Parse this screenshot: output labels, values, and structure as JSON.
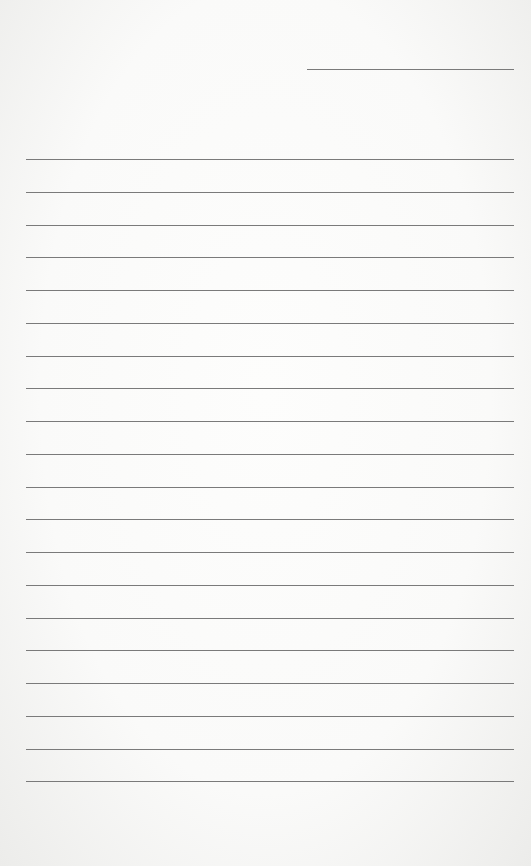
{
  "document": {
    "type": "lined-paper",
    "background_color": "#fafaf9",
    "line_color": "#7a7a7a",
    "header_line": {
      "x": 307,
      "y": 69,
      "width": 207
    },
    "ruled_lines": {
      "count": 20,
      "x": 26,
      "width": 488,
      "first_y": 159,
      "spacing": 32.75
    }
  }
}
